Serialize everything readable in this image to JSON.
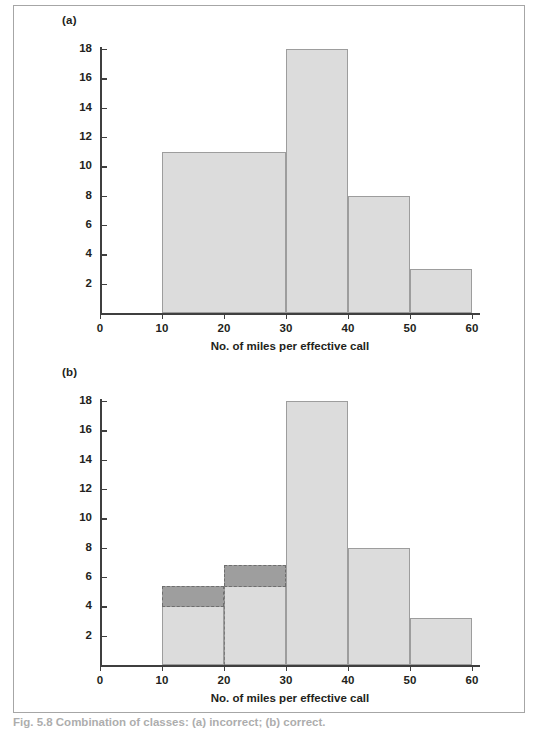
{
  "figure": {
    "caption": "Fig. 5.8  Combination of classes: (a) incorrect; (b) correct."
  },
  "panels": [
    {
      "label": "(a)"
    },
    {
      "label": "(b)"
    }
  ],
  "axis": {
    "xlabel": "No. of miles per effective call",
    "x_ticks": [
      "0",
      "10",
      "20",
      "30",
      "40",
      "50",
      "60"
    ],
    "y_ticks": [
      "2",
      "4",
      "6",
      "8",
      "10",
      "12",
      "14",
      "16",
      "18"
    ]
  },
  "colors": {
    "bar_fill": "#dcdcdc",
    "bar_edge": "#9d9d9d",
    "overlay_fill": "#9e9e9e",
    "overlay_edge": "#6e6e6e",
    "axis": "#3f3f3f",
    "frame": "#a6a6a6"
  },
  "chart_data": [
    {
      "type": "bar",
      "title": "(a)",
      "xlabel": "No. of miles per effective call",
      "ylabel": "",
      "xlim": [
        0,
        60
      ],
      "ylim": [
        0,
        18
      ],
      "grid": false,
      "legend": "none",
      "note": "Histogram with unequal class widths drawn incorrectly: the 10-30 class is shown as one bar of height 11 (the raw frequency) instead of being adjusted for its double width.",
      "bins": [
        {
          "start": 10,
          "end": 30,
          "height": 11
        },
        {
          "start": 30,
          "end": 40,
          "height": 18
        },
        {
          "start": 40,
          "end": 50,
          "height": 8
        },
        {
          "start": 50,
          "end": 60,
          "height": 3
        }
      ]
    },
    {
      "type": "bar",
      "title": "(b)",
      "xlabel": "No. of miles per effective call",
      "ylabel": "",
      "xlim": [
        0,
        60
      ],
      "ylim": [
        0,
        18
      ],
      "grid": false,
      "legend": "none",
      "note": "Correct histogram: frequencies are rescaled to frequency density. Dark grey blocks with dashed outlines mark the incorrect heights from panel (a) for comparison.",
      "bins": [
        {
          "start": 10,
          "end": 20,
          "height": 4
        },
        {
          "start": 20,
          "end": 30,
          "height": 5.4
        },
        {
          "start": 30,
          "end": 40,
          "height": 18
        },
        {
          "start": 40,
          "end": 50,
          "height": 8
        },
        {
          "start": 50,
          "end": 60,
          "height": 3.2
        }
      ],
      "overlays": [
        {
          "start": 10,
          "end": 20,
          "from": 4,
          "to": 5.4
        },
        {
          "start": 20,
          "end": 30,
          "from": 5.4,
          "to": 6.8
        }
      ],
      "dashed_dividers": [
        {
          "x": 20,
          "from": 0,
          "to": 5.4
        }
      ]
    }
  ]
}
